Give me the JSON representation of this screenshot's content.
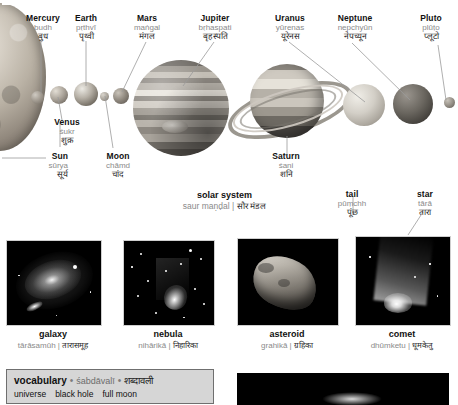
{
  "page": {
    "title": "solar system",
    "title_translit": "saur maṇḍal",
    "title_devanagari": "सौर मंडल"
  },
  "colors": {
    "label_en": "#111111",
    "label_translit": "#8a8a8a",
    "label_devanagari": "#2a2a2a",
    "leader_line": "#9a9a9a",
    "vocab_box_bg": "#d6d6d6",
    "vocab_box_border": "#6f6f6f",
    "photo_bg": "#000000"
  },
  "solar_system": {
    "labels": [
      {
        "id": "sun",
        "en": "Sun",
        "translit": "sūrya",
        "hi": "सूर्य"
      },
      {
        "id": "mercury",
        "en": "Mercury",
        "translit": "budh",
        "hi": "बुध"
      },
      {
        "id": "venus",
        "en": "Venus",
        "translit": "śukr",
        "hi": "शुक्र"
      },
      {
        "id": "earth",
        "en": "Earth",
        "translit": "pṛthvī",
        "hi": "पृथ्वी"
      },
      {
        "id": "moon",
        "en": "Moon",
        "translit": "chāmd",
        "hi": "चांद"
      },
      {
        "id": "mars",
        "en": "Mars",
        "translit": "maṅgal",
        "hi": "मंगल"
      },
      {
        "id": "jupiter",
        "en": "Jupiter",
        "translit": "bṛhaspati",
        "hi": "बृहस्पति"
      },
      {
        "id": "saturn",
        "en": "Saturn",
        "translit": "śani",
        "hi": "शनि"
      },
      {
        "id": "uranus",
        "en": "Uranus",
        "translit": "yūrenas",
        "hi": "यूरेनस"
      },
      {
        "id": "neptune",
        "en": "Neptune",
        "translit": "nepchyūn",
        "hi": "नेपच्यून"
      },
      {
        "id": "pluto",
        "en": "Pluto",
        "translit": "plūṭo",
        "hi": "प्लूटो"
      }
    ]
  },
  "comet_labels": [
    {
      "id": "tail",
      "en": "tail",
      "translit": "pūṃchh",
      "hi": "पूंछ"
    },
    {
      "id": "star",
      "en": "star",
      "translit": "tārā",
      "hi": "तारा"
    }
  ],
  "photos": [
    {
      "id": "galaxy",
      "en": "galaxy",
      "translit": "tārāsamūh",
      "hi": "तारासमूह"
    },
    {
      "id": "nebula",
      "en": "nebula",
      "translit": "nihārikā",
      "hi": "निहारिका"
    },
    {
      "id": "asteroid",
      "en": "asteroid",
      "translit": "grahikā",
      "hi": "ग्रहिका"
    },
    {
      "id": "comet",
      "en": "comet",
      "translit": "dhūmketu",
      "hi": "धूमकेतु"
    }
  ],
  "vocabulary": {
    "heading_en": "vocabulary",
    "heading_translit": "śabdāvalī",
    "heading_hi": "शब्दावली",
    "bullet": "•",
    "separator": "|",
    "terms": [
      "universe",
      "black hole",
      "full moon"
    ]
  }
}
